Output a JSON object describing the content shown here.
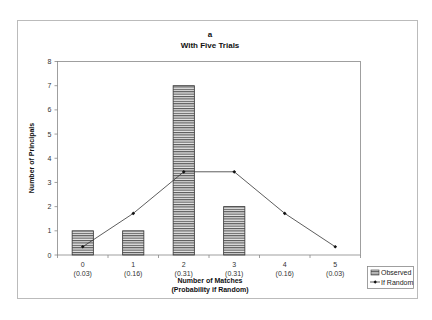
{
  "chart_data": {
    "type": "bar",
    "title": "a",
    "subtitle": "With Five Trials",
    "xlabel": "Number of Matches",
    "xlabel_sub": "(Probability if Random)",
    "ylabel": "Number of Principals",
    "categories": [
      "0",
      "1",
      "2",
      "3",
      "4",
      "5"
    ],
    "category_probabilities": [
      "(0.03)",
      "(0.16)",
      "(0.31)",
      "(0.31)",
      "(0.16)",
      "(0.03)"
    ],
    "ylim": [
      0,
      8
    ],
    "yticks": [
      0,
      1,
      2,
      3,
      4,
      5,
      6,
      7,
      8
    ],
    "grid": false,
    "legend_position": "bottom-right",
    "series": [
      {
        "name": "Observed",
        "kind": "bar",
        "pattern": "horizontal-stripes",
        "values": [
          1,
          1,
          7,
          2,
          0,
          0
        ]
      },
      {
        "name": "If Random",
        "kind": "line",
        "marker": "diamond",
        "values": [
          0.34,
          1.72,
          3.44,
          3.44,
          1.72,
          0.34
        ]
      }
    ],
    "colors": {
      "bar_stroke": "#333333",
      "bar_stripe_dark": "#555555",
      "bar_stripe_light": "#e8e8e8",
      "line": "#333333",
      "axis": "#888888",
      "frame": "#bbbbbb"
    }
  }
}
